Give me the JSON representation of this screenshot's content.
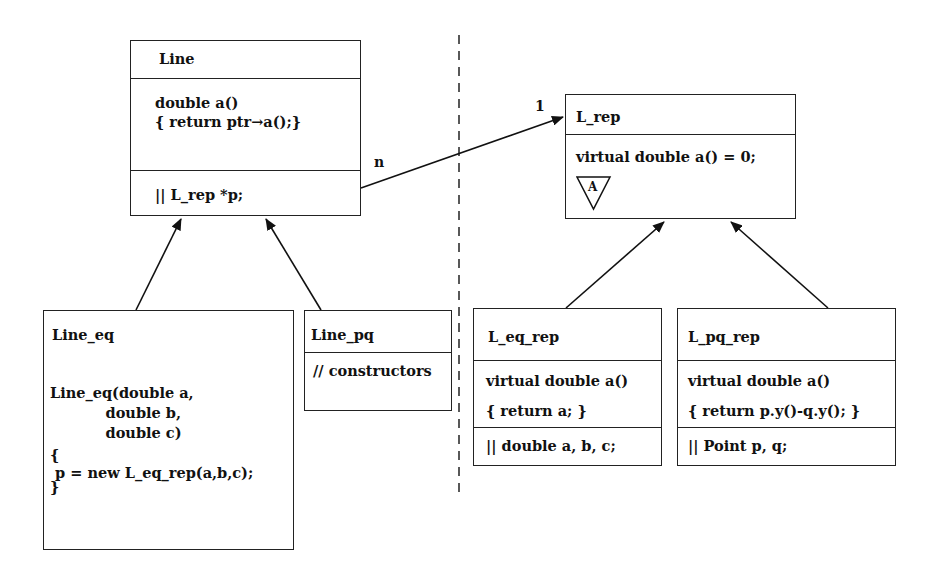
{
  "diagram": {
    "separator": {
      "style": "dashed",
      "x": 459
    },
    "association": {
      "from": "Line",
      "to": "L_rep",
      "multiplicity_from": "n",
      "multiplicity_to": "1"
    },
    "left": {
      "line": {
        "name": "Line",
        "methods": [
          "double a()",
          "{ return ptr→a();}"
        ],
        "fields": "|| L_rep *p;"
      },
      "line_eq": {
        "name": "Line_eq",
        "body": [
          "Line_eq(double a,",
          "           double b,",
          "           double c)",
          "{",
          " p = new L_eq_rep(a,b,c);",
          "}"
        ]
      },
      "line_pq": {
        "name": "Line_pq",
        "body": "// constructors"
      }
    },
    "right": {
      "l_rep": {
        "name": "L_rep",
        "methods": "virtual double a() = 0;",
        "abstract_marker": "A"
      },
      "l_eq_rep": {
        "name": "L_eq_rep",
        "methods": [
          "virtual double a()",
          "{ return a; }"
        ],
        "fields": "|| double a, b, c;"
      },
      "l_pq_rep": {
        "name": "L_pq_rep",
        "methods": [
          "virtual double a()",
          "{ return p.y()-q.y(); }"
        ],
        "fields": "|| Point p, q;"
      }
    }
  }
}
